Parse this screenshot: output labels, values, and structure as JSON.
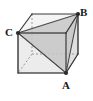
{
  "figure": {
    "kind": "geometry-diagram",
    "width": 93,
    "height": 101,
    "background_color": "#ffffff"
  },
  "labels": {
    "a": "A",
    "b": "B",
    "c": "C"
  },
  "colors": {
    "edge_solid": "#3a3a3a",
    "edge_hidden": "#8d8d8d",
    "face_front": "#e8e8e8",
    "face_top": "#f2f2f2",
    "face_right": "#dcdcdc",
    "triangle_fill": "#c9c9c9",
    "triangle_stroke": "#4a4a4a",
    "label_color": "#1a1a1a"
  },
  "geometry": {
    "vertices": {
      "front_bottom_left": [
        18,
        73
      ],
      "front_bottom_right": [
        66,
        73
      ],
      "front_top_left": [
        18,
        33
      ],
      "front_top_right": [
        66,
        33
      ],
      "back_bottom_left": [
        32,
        54
      ],
      "back_bottom_right": [
        78,
        54
      ],
      "back_top_left": [
        32,
        14
      ],
      "back_top_right": [
        78,
        14
      ]
    },
    "named_points": {
      "A": [
        66,
        73
      ],
      "B": [
        78,
        14
      ],
      "C": [
        18,
        33
      ]
    },
    "triangle": [
      "A",
      "B",
      "C"
    ],
    "hidden_edges": [
      [
        "back_bottom_left",
        "back_top_left"
      ],
      [
        "back_bottom_left",
        "front_bottom_left"
      ],
      [
        "back_bottom_left",
        "back_bottom_right"
      ]
    ],
    "triangle_interior_segments": [
      [
        "C",
        "front_bottom_left"
      ],
      [
        "front_bottom_left",
        "A"
      ],
      [
        "C",
        "front_top_right"
      ],
      [
        "front_top_right",
        "B"
      ],
      [
        "C",
        "A"
      ],
      [
        "A",
        "back_bottom_right"
      ],
      [
        "back_bottom_right",
        "B"
      ]
    ]
  }
}
